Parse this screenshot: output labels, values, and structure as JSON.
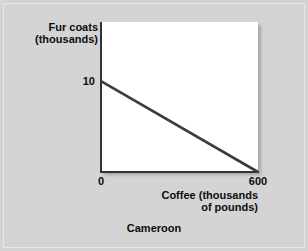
{
  "chart_data": {
    "type": "line",
    "title": "",
    "caption": "Cameroon",
    "xlabel_line1": "Coffee (thousands",
    "xlabel_line2": "of pounds)",
    "ylabel_line1": "Fur coats",
    "ylabel_line2": "(thousands)",
    "xlim": [
      0,
      600
    ],
    "ylim": [
      0,
      16.5
    ],
    "x_ticks": [
      "0",
      "600"
    ],
    "x_tick_values": [
      0,
      600
    ],
    "y_ticks": [
      "10"
    ],
    "y_tick_values": [
      10
    ],
    "grid": false,
    "legend": "none",
    "series": [
      {
        "name": "Production possibilities frontier",
        "x": [
          0,
          600
        ],
        "values": [
          10,
          0
        ],
        "color": "#3d3d3d"
      }
    ],
    "annotations": []
  },
  "figure": {
    "background_color": "#d4d4d4",
    "plot_background_color": "#ffffff",
    "axis_color": "#333333",
    "text_color": "#0d0d0d"
  }
}
